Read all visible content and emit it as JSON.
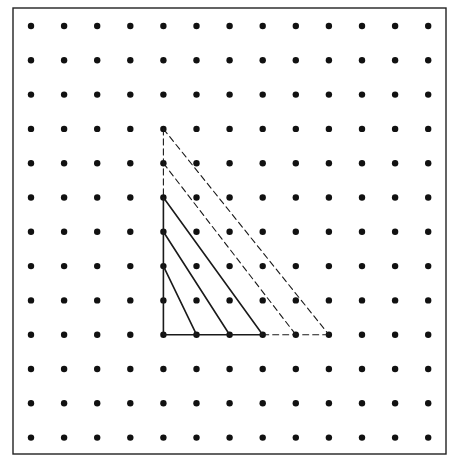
{
  "diagram": {
    "type": "geoboard-dot-grid",
    "frame": {
      "x1": 13,
      "y1": 8,
      "x2": 446,
      "y2": 454,
      "stroke": "#222222",
      "width": 1.4
    },
    "grid": {
      "cols": 13,
      "rows": 13,
      "origin_x": 31,
      "origin_y": 26,
      "dx": 33.1,
      "dy": 34.3,
      "dot_radius": 3.2,
      "dot_color": "#111111"
    },
    "right_angle_vertex": {
      "col": 4,
      "row": 9
    },
    "segments": [
      {
        "name": "vertical-leg-solid",
        "from": [
          4,
          5
        ],
        "to": [
          4,
          9
        ],
        "style": "solid"
      },
      {
        "name": "vertical-leg-dashed",
        "from": [
          4,
          3
        ],
        "to": [
          4,
          5
        ],
        "style": "dashed"
      },
      {
        "name": "horizontal-leg-solid",
        "from": [
          4,
          9
        ],
        "to": [
          7,
          9
        ],
        "style": "solid"
      },
      {
        "name": "horizontal-leg-dashed",
        "from": [
          7,
          9
        ],
        "to": [
          9,
          9
        ],
        "style": "dashed"
      },
      {
        "name": "hypotenuse-1",
        "from": [
          4,
          7
        ],
        "to": [
          5,
          9
        ],
        "style": "solid"
      },
      {
        "name": "hypotenuse-2",
        "from": [
          4,
          6
        ],
        "to": [
          6,
          9
        ],
        "style": "solid"
      },
      {
        "name": "hypotenuse-3",
        "from": [
          4,
          5
        ],
        "to": [
          7,
          9
        ],
        "style": "solid"
      },
      {
        "name": "hypotenuse-4",
        "from": [
          4,
          4
        ],
        "to": [
          8,
          9
        ],
        "style": "dashed"
      },
      {
        "name": "hypotenuse-5",
        "from": [
          4,
          3
        ],
        "to": [
          9,
          9
        ],
        "style": "dashed"
      }
    ],
    "line_color": "#1a1a1a",
    "solid_width": 1.6,
    "dashed_width": 1.1,
    "dash_pattern": "6 4"
  }
}
